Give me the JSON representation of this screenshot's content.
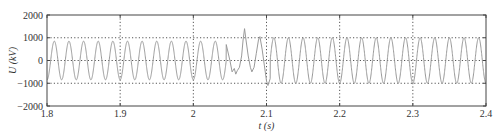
{
  "chart_data": {
    "type": "line",
    "title": "",
    "xlabel": "t (s)",
    "ylabel": "U (kV)",
    "xlim": [
      1.8,
      2.4
    ],
    "ylim": [
      -2000,
      2000
    ],
    "xticks": [
      1.8,
      1.9,
      2.0,
      2.1,
      2.2,
      2.3,
      2.4
    ],
    "xtick_labels": [
      "1.8",
      "1.9",
      "2",
      "2.1",
      "2.2",
      "2.3",
      "2.4"
    ],
    "yticks": [
      2000,
      1000,
      0,
      -1000,
      -2000
    ],
    "ytick_labels": [
      "2000",
      "1000",
      "0",
      "−1000",
      "−2000"
    ],
    "grid": {
      "style": "dotted",
      "x_lines": [
        1.9,
        2.0,
        2.1,
        2.2,
        2.3
      ],
      "y_lines": [
        1000,
        0,
        -1000
      ]
    },
    "legend": null,
    "series": [
      {
        "name": "U",
        "color": "#9a9a9a",
        "frequency_hz": 50,
        "pre_disturbance_amplitude_kv": 850,
        "post_disturbance_amplitude_kv": 1000,
        "disturbance_window_s": [
          2.045,
          2.105
        ],
        "disturbance_points": [
          [
            2.045,
            700
          ],
          [
            2.05,
            0
          ],
          [
            2.053,
            -500
          ],
          [
            2.056,
            -350
          ],
          [
            2.058,
            -600
          ],
          [
            2.06,
            -450
          ],
          [
            2.063,
            -300
          ],
          [
            2.066,
            200
          ],
          [
            2.068,
            900
          ],
          [
            2.07,
            1400
          ],
          [
            2.072,
            900
          ],
          [
            2.075,
            200
          ],
          [
            2.078,
            -300
          ],
          [
            2.08,
            -500
          ],
          [
            2.083,
            -300
          ],
          [
            2.086,
            300
          ],
          [
            2.089,
            900
          ],
          [
            2.091,
            1050
          ],
          [
            2.094,
            500
          ],
          [
            2.097,
            -200
          ],
          [
            2.1,
            -900
          ],
          [
            2.102,
            -1100
          ],
          [
            2.105,
            -800
          ]
        ]
      }
    ]
  }
}
